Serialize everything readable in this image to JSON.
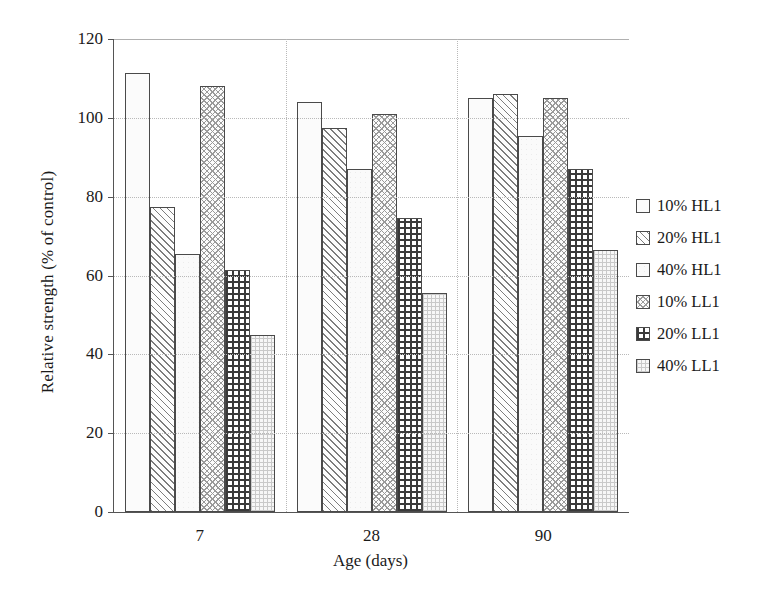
{
  "chart_data": {
    "type": "bar",
    "title": "",
    "xlabel": "Age (days)",
    "ylabel": "Relative strength (% of control)",
    "categories": [
      "7",
      "28",
      "90"
    ],
    "ylim": [
      0,
      120
    ],
    "yticks": [
      0,
      20,
      40,
      60,
      80,
      100,
      120
    ],
    "grid": true,
    "legend_position": "right",
    "series": [
      {
        "name": "10% HL1",
        "pattern": "light-dotted",
        "values": [
          111.5,
          104.0,
          105.0
        ]
      },
      {
        "name": "20% HL1",
        "pattern": "diagonal-hatch",
        "values": [
          77.5,
          97.5,
          106.0
        ]
      },
      {
        "name": "40% HL1",
        "pattern": "plain-light",
        "values": [
          65.5,
          87.0,
          95.5
        ]
      },
      {
        "name": "10% LL1",
        "pattern": "scale-weave",
        "values": [
          108.0,
          101.0,
          105.0
        ]
      },
      {
        "name": "20% LL1",
        "pattern": "bold-grid",
        "values": [
          61.5,
          74.5,
          87.0
        ]
      },
      {
        "name": "40% LL1",
        "pattern": "fine-grid",
        "values": [
          45.0,
          55.5,
          66.5
        ]
      }
    ]
  },
  "axis": {
    "y_tick_labels": [
      "120",
      "100",
      "80",
      "60",
      "40",
      "20",
      "0"
    ],
    "x_tick_labels": [
      "7",
      "28",
      "90"
    ]
  },
  "legend": {
    "items": [
      {
        "label": "10% HL1"
      },
      {
        "label": "20% HL1"
      },
      {
        "label": "40% HL1"
      },
      {
        "label": "10% LL1"
      },
      {
        "label": "20% LL1"
      },
      {
        "label": "40% LL1"
      }
    ]
  },
  "colors": {
    "axis": "#555555",
    "grid": "#b9b9b9",
    "bar_outline": "#4a4a4a",
    "text": "#1a1a1a"
  }
}
